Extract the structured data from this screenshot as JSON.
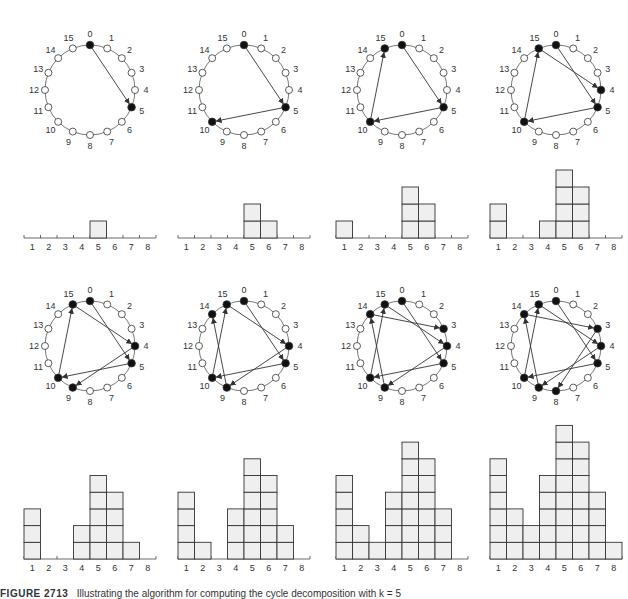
{
  "figure": {
    "caption_label": "FIGURE 2713",
    "caption_text": "Illustrating the algorithm for computing the cycle decomposition with k = 5"
  },
  "settings": {
    "n_nodes": 16,
    "step": 5,
    "node_labels": [
      "0",
      "1",
      "2",
      "3",
      "4",
      "5",
      "6",
      "7",
      "8",
      "9",
      "10",
      "11",
      "12",
      "13",
      "14",
      "15"
    ],
    "histogram_categories": [
      "1",
      "2",
      "3",
      "4",
      "5",
      "6",
      "7",
      "8"
    ],
    "colors": {
      "line": "#333333",
      "filled_node": "#111111",
      "bar_fill": "#efefef",
      "bar_stroke": "#333333"
    }
  },
  "panels": [
    {
      "path": [
        0,
        5
      ],
      "filled": [
        0,
        5
      ],
      "histogram": [
        0,
        0,
        0,
        0,
        1,
        0,
        0,
        0
      ]
    },
    {
      "path": [
        0,
        5,
        10
      ],
      "filled": [
        0,
        5,
        10
      ],
      "histogram": [
        0,
        0,
        0,
        0,
        2,
        1,
        0,
        0
      ]
    },
    {
      "path": [
        0,
        5,
        10,
        15
      ],
      "filled": [
        0,
        5,
        10,
        15
      ],
      "histogram": [
        1,
        0,
        0,
        0,
        3,
        2,
        0,
        0
      ]
    },
    {
      "path": [
        0,
        5,
        10,
        15,
        4
      ],
      "filled": [
        0,
        5,
        10,
        15,
        4
      ],
      "histogram": [
        2,
        0,
        0,
        1,
        4,
        3,
        0,
        0
      ]
    },
    {
      "path": [
        0,
        5,
        10,
        15,
        4,
        9
      ],
      "filled": [
        0,
        5,
        10,
        15,
        4,
        9
      ],
      "histogram": [
        3,
        0,
        0,
        2,
        5,
        4,
        1,
        0
      ]
    },
    {
      "path": [
        0,
        5,
        10,
        15,
        4,
        9,
        14
      ],
      "filled": [
        0,
        5,
        10,
        15,
        4,
        9,
        14
      ],
      "histogram": [
        4,
        1,
        0,
        3,
        6,
        5,
        2,
        0
      ]
    },
    {
      "path": [
        0,
        5,
        10,
        15,
        4,
        9,
        14,
        3
      ],
      "filled": [
        0,
        5,
        10,
        15,
        4,
        9,
        14,
        3
      ],
      "histogram": [
        5,
        2,
        1,
        4,
        7,
        6,
        3,
        0
      ]
    },
    {
      "path": [
        0,
        5,
        10,
        15,
        4,
        9,
        14,
        3,
        8
      ],
      "filled": [
        0,
        5,
        10,
        15,
        4,
        9,
        14,
        3,
        8
      ],
      "histogram": [
        6,
        3,
        2,
        5,
        8,
        7,
        4,
        1
      ]
    }
  ],
  "chart_data": {
    "type": "bar",
    "categories": [
      "1",
      "2",
      "3",
      "4",
      "5",
      "6",
      "7",
      "8"
    ],
    "series": [
      {
        "name": "step 1",
        "values": [
          0,
          0,
          0,
          0,
          1,
          0,
          0,
          0
        ]
      },
      {
        "name": "step 2",
        "values": [
          0,
          0,
          0,
          0,
          2,
          1,
          0,
          0
        ]
      },
      {
        "name": "step 3",
        "values": [
          1,
          0,
          0,
          0,
          3,
          2,
          0,
          0
        ]
      },
      {
        "name": "step 4",
        "values": [
          2,
          0,
          0,
          1,
          4,
          3,
          0,
          0
        ]
      },
      {
        "name": "step 5",
        "values": [
          3,
          0,
          0,
          2,
          5,
          4,
          1,
          0
        ]
      },
      {
        "name": "step 6",
        "values": [
          4,
          1,
          0,
          3,
          6,
          5,
          2,
          0
        ]
      },
      {
        "name": "step 7",
        "values": [
          5,
          2,
          1,
          4,
          7,
          6,
          3,
          0
        ]
      },
      {
        "name": "step 8",
        "values": [
          6,
          3,
          2,
          5,
          8,
          7,
          4,
          1
        ]
      }
    ],
    "xlabel": "",
    "ylabel": "",
    "grid": false
  }
}
